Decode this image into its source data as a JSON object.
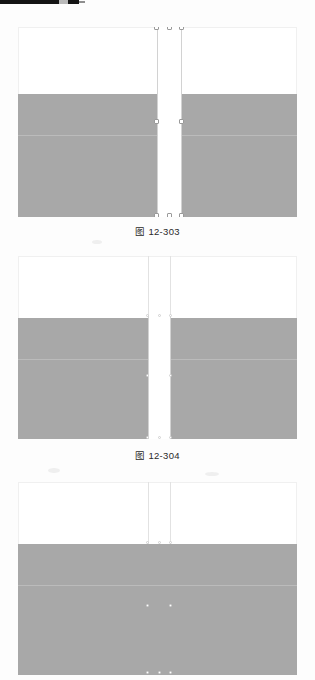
{
  "page": {
    "width": 315,
    "height": 680,
    "background_color": "#fdfdfd",
    "kind": "scanned-textbook-page",
    "scan_artifact": {
      "name": "top-edge-dark-bar",
      "color": "#141414",
      "notch_color": "#b9b9b9"
    }
  },
  "figures": [
    {
      "id": "fig-303",
      "caption": "图 12-303",
      "canvas": {
        "left": 18,
        "top": 27,
        "width": 279,
        "height": 190,
        "outline_color": "#f0f0f0",
        "background_color": "#ffffff"
      },
      "grey_band": {
        "color": "#a8a8a8",
        "top_offset": 67,
        "height": 123,
        "description": "shaded table body occupying lower portion"
      },
      "selection": {
        "left_offset": 139,
        "width": 25,
        "top_offset": 0,
        "height": 190,
        "fill": "#ffffff",
        "border_color": "#d2d2d2",
        "handle_fill": "#ffffff",
        "handle_border": "#9a9a9a",
        "handles": [
          "top-left",
          "top-center",
          "top-right",
          "middle-left",
          "middle-right",
          "bottom-left",
          "bottom-center",
          "bottom-right"
        ]
      }
    },
    {
      "id": "fig-304",
      "caption": "图 12-304",
      "canvas": {
        "left": 18,
        "top": 256,
        "width": 279,
        "height": 183,
        "outline_color": "#f0f0f0",
        "background_color": "#ffffff"
      },
      "grey_band": {
        "color": "#a8a8a8",
        "top_offset": 62,
        "height": 121,
        "description": "shaded table body occupying lower portion"
      },
      "selection": {
        "left_offset": 130,
        "width": 23,
        "top_offset": 60,
        "height": 123,
        "fill": "#ffffff",
        "border_color": "#d2d2d2",
        "handle_fill": "#ffffff",
        "handle_border": "#9a9a9a",
        "handles": [
          "top-left",
          "top-center",
          "top-right",
          "middle-left",
          "middle-right",
          "bottom-left",
          "bottom-center",
          "bottom-right"
        ]
      }
    },
    {
      "id": "fig-305",
      "caption": "",
      "canvas": {
        "left": 18,
        "top": 482,
        "width": 279,
        "height": 193,
        "outline_color": "#f0f0f0",
        "background_color": "#ffffff"
      },
      "grey_band": {
        "color": "#a8a8a8",
        "top_offset": 62,
        "height": 131,
        "description": "shaded table body fully merged, no white gap column"
      },
      "selection": {
        "left_offset": 130,
        "width": 23,
        "top_offset": 60,
        "height": 133,
        "fill": "transparent",
        "border_color": "#bdbdbd",
        "handle_fill": "#ffffff",
        "handle_border": "#cfcfcf",
        "collapsed": true,
        "handles": [
          "top-left",
          "top-center",
          "top-right",
          "middle-left",
          "middle-right",
          "bottom-left",
          "bottom-center",
          "bottom-right"
        ]
      }
    }
  ]
}
